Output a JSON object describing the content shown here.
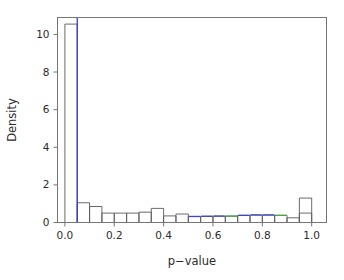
{
  "chart_data": {
    "type": "bar",
    "title": "",
    "subtitle": "",
    "xlabel": "p−value",
    "ylabel": "Density",
    "xlim": [
      -0.03,
      1.06
    ],
    "ylim": [
      0,
      10.9
    ],
    "grid": false,
    "legend": null,
    "bin_width": 0.05,
    "xticks": [
      0.0,
      0.2,
      0.4,
      0.6,
      0.8,
      1.0
    ],
    "xticklabels": [
      "0.0",
      "0.2",
      "0.4",
      "0.6",
      "0.8",
      "1.0"
    ],
    "yticks": [
      0,
      2,
      4,
      6,
      8,
      10
    ],
    "yticklabels": [
      "0",
      "2",
      "4",
      "6",
      "8",
      "10"
    ],
    "bin_edges": [
      0.0,
      0.05,
      0.1,
      0.15,
      0.2,
      0.25,
      0.3,
      0.35,
      0.4,
      0.45,
      0.5,
      0.55,
      0.6,
      0.65,
      0.7,
      0.75,
      0.8,
      0.85,
      0.9,
      0.95,
      1.0
    ],
    "categories": [
      "0.00–0.05",
      "0.05–0.10",
      "0.10–0.15",
      "0.15–0.20",
      "0.20–0.25",
      "0.25–0.30",
      "0.30–0.35",
      "0.35–0.40",
      "0.40–0.45",
      "0.45–0.50",
      "0.50–0.55",
      "0.55–0.60",
      "0.60–0.65",
      "0.65–0.70",
      "0.70–0.75",
      "0.75–0.80",
      "0.80–0.85",
      "0.85–0.90",
      "0.90–0.95",
      "0.95–1.00"
    ],
    "values": [
      10.55,
      1.05,
      0.85,
      0.5,
      0.5,
      0.5,
      0.55,
      0.75,
      0.35,
      0.45,
      0.32,
      0.33,
      0.34,
      0.34,
      0.38,
      0.4,
      0.4,
      0.38,
      0.25,
      0.5
    ],
    "bar_top_colors": [
      "dark",
      "dark",
      "dark",
      "dark",
      "dark",
      "dark",
      "dark",
      "dark",
      "dark",
      "dark",
      "blue",
      "blue",
      "blue",
      "green",
      "blue",
      "blue",
      "blue",
      "green",
      "dark",
      "dark"
    ],
    "extra_bar": {
      "label": "0.95–1.00 tall",
      "x_start": 0.95,
      "x_end": 1.0,
      "value": 1.3
    },
    "annotations": [
      {
        "name": "significance-threshold-line",
        "type": "vline",
        "x": 0.05,
        "color": "#3c3cc8",
        "label": ""
      }
    ],
    "colors": {
      "bar_outline": "#5a5a5a",
      "axis": "#767676",
      "blue": "#3c46c8",
      "green": "#45a845",
      "text": "#2b2b2b",
      "background": "#ffffff"
    }
  }
}
